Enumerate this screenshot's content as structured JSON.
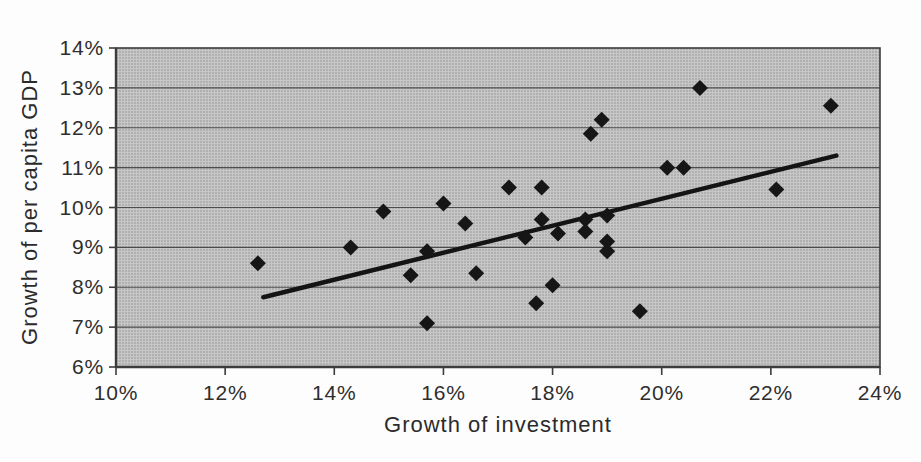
{
  "chart_data": {
    "type": "scatter",
    "title": "",
    "xlabel": "Growth of investment",
    "ylabel": "Growth of per capita GDP",
    "xlim": [
      10,
      24
    ],
    "ylim": [
      6,
      14
    ],
    "x_tick_step": 2,
    "y_tick_step": 1,
    "x_tick_labels": [
      "10%",
      "12%",
      "14%",
      "16%",
      "18%",
      "20%",
      "22%",
      "24%"
    ],
    "y_tick_labels": [
      "6%",
      "7%",
      "8%",
      "9%",
      "10%",
      "11%",
      "12%",
      "13%",
      "14%"
    ],
    "grid": "horizontal",
    "legend": "none",
    "marker": "diamond",
    "marker_color": "#161616",
    "plot_background": "#c7c7c7",
    "gridline_color": "#4c4c4c",
    "border_color": "#3c3c3c",
    "trendline_color": "#141414",
    "points": [
      [
        12.6,
        8.6
      ],
      [
        14.3,
        9.0
      ],
      [
        14.9,
        9.9
      ],
      [
        15.4,
        8.3
      ],
      [
        15.7,
        8.9
      ],
      [
        15.7,
        7.1
      ],
      [
        16.0,
        10.1
      ],
      [
        16.4,
        9.6
      ],
      [
        16.6,
        8.35
      ],
      [
        17.2,
        10.5
      ],
      [
        17.5,
        9.25
      ],
      [
        17.7,
        7.6
      ],
      [
        17.8,
        10.5
      ],
      [
        17.8,
        9.7
      ],
      [
        18.0,
        8.05
      ],
      [
        18.1,
        9.35
      ],
      [
        18.6,
        9.7
      ],
      [
        18.6,
        9.4
      ],
      [
        18.7,
        11.85
      ],
      [
        18.9,
        12.2
      ],
      [
        19.0,
        9.8
      ],
      [
        19.0,
        9.15
      ],
      [
        19.0,
        8.9
      ],
      [
        19.6,
        7.4
      ],
      [
        20.1,
        11.0
      ],
      [
        20.4,
        11.0
      ],
      [
        20.7,
        13.0
      ],
      [
        22.1,
        10.45
      ],
      [
        23.1,
        12.55
      ]
    ],
    "trendline": [
      [
        12.7,
        7.75
      ],
      [
        23.2,
        11.3
      ]
    ]
  }
}
